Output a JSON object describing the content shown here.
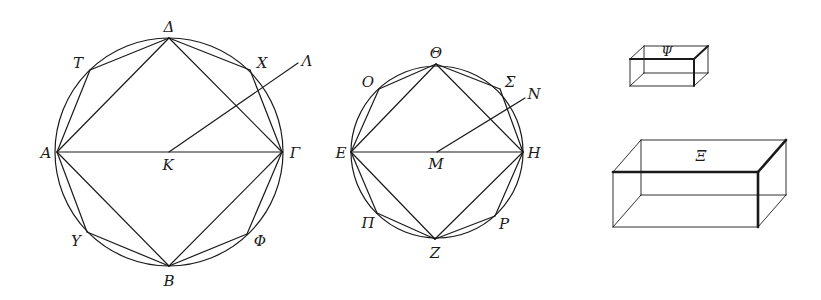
{
  "figure": {
    "stroke_color": "#1a1a1a"
  },
  "circle_1": {
    "center": {
      "label": "K",
      "x": 169,
      "y": 152
    },
    "radius": 114,
    "square": [
      {
        "label": "Α",
        "x": 57,
        "y": 152,
        "lx": 46,
        "ly": 153
      },
      {
        "label": "Δ",
        "x": 169,
        "y": 38,
        "lx": 169,
        "ly": 27
      },
      {
        "label": "Γ",
        "x": 282,
        "y": 152,
        "lx": 295,
        "ly": 153
      },
      {
        "label": "Β",
        "x": 169,
        "y": 266,
        "lx": 169,
        "ly": 281
      }
    ],
    "octagon_points": [
      {
        "label": "Τ",
        "x": 90,
        "y": 70,
        "lx": 78,
        "ly": 63
      },
      {
        "label": "Χ",
        "x": 250,
        "y": 70,
        "lx": 262,
        "ly": 63
      },
      {
        "label": "Φ",
        "x": 247,
        "y": 234,
        "lx": 260,
        "ly": 241
      },
      {
        "label": "Υ",
        "x": 87,
        "y": 232,
        "lx": 76,
        "ly": 241
      }
    ],
    "center_label": {
      "label": "Κ",
      "lx": 168,
      "ly": 165
    },
    "ray": {
      "label": "Λ",
      "x2": 298,
      "y2": 63,
      "lx": 307,
      "ly": 61
    }
  },
  "circle_2": {
    "center": {
      "label": "M",
      "x": 437,
      "y": 152
    },
    "radius": 86,
    "square": [
      {
        "label": "Ε",
        "x": 351,
        "y": 152,
        "lx": 341,
        "ly": 153
      },
      {
        "label": "Θ",
        "x": 436,
        "y": 64,
        "lx": 436,
        "ly": 53
      },
      {
        "label": "Η",
        "x": 523,
        "y": 152,
        "lx": 534,
        "ly": 153
      },
      {
        "label": "Ζ",
        "x": 435,
        "y": 239,
        "lx": 435,
        "ly": 253
      }
    ],
    "octagon_points": [
      {
        "label": "Ο",
        "x": 379,
        "y": 89,
        "lx": 368,
        "ly": 82
      },
      {
        "label": "Σ",
        "x": 500,
        "y": 89,
        "lx": 510,
        "ly": 82
      },
      {
        "label": "Ρ",
        "x": 495,
        "y": 216,
        "lx": 504,
        "ly": 224
      },
      {
        "label": "Π",
        "x": 377,
        "y": 213,
        "lx": 368,
        "ly": 223
      }
    ],
    "center_label": {
      "label": "Μ",
      "lx": 436,
      "ly": 164
    },
    "ray": {
      "label": "Ν",
      "x2": 525,
      "y2": 98,
      "lx": 534,
      "ly": 94
    }
  },
  "solids": [
    {
      "label": "Ψ",
      "front": {
        "x": 630,
        "y": 59,
        "w": 64,
        "h": 27
      },
      "depth": {
        "dx": 14,
        "dy": -13
      },
      "lx": 667,
      "ly": 51,
      "small": true
    },
    {
      "label": "Ξ",
      "front": {
        "x": 613,
        "y": 172,
        "w": 145,
        "h": 55
      },
      "depth": {
        "dx": 28,
        "dy": -32
      },
      "lx": 701,
      "ly": 156,
      "small": false
    }
  ]
}
